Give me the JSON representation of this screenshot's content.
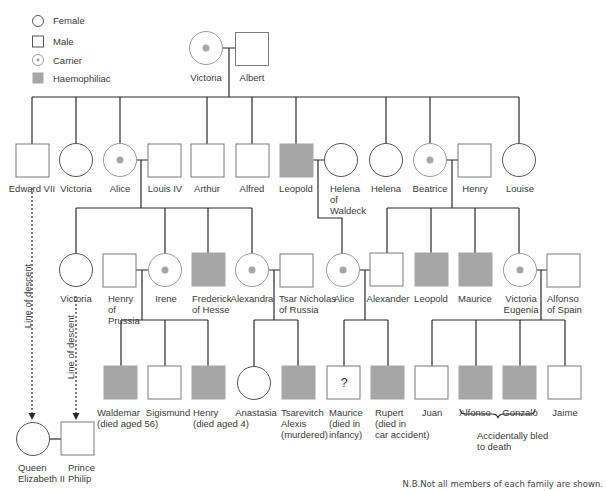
{
  "legend": {
    "items": [
      {
        "symbol": "female-circle",
        "label": "Female"
      },
      {
        "symbol": "male-square",
        "label": "Male"
      },
      {
        "symbol": "carrier-dot",
        "label": "Carrier"
      },
      {
        "symbol": "haemophiliac-fill",
        "label": "Haemophiliac"
      }
    ]
  },
  "colors": {
    "line": "#2a2a2a",
    "outline": "#8a8a8a",
    "affected": "#a6a6a6",
    "carrier_dot": "#a6a6a6"
  },
  "generation1": {
    "victoria": "Victoria",
    "albert": "Albert"
  },
  "generation2": {
    "edward": "Edward VII",
    "victoria": "Victoria",
    "alice": "Alice",
    "louis": "Louis IV",
    "arthur": "Arthur",
    "alfred": "Alfred",
    "leopold": "Leopold",
    "helena_waldeck": [
      "Helena",
      "of",
      "Waldeck"
    ],
    "helena": "Helena",
    "beatrice": "Beatrice",
    "henry": "Henry",
    "louise": "Louise"
  },
  "generation3": {
    "victoria": "Victoria",
    "henry_prussia": [
      "Henry",
      "of",
      "Prussia"
    ],
    "irene": "Irene",
    "frederick": [
      "Frederick",
      "of Hesse"
    ],
    "alexandra": "Alexandra",
    "tsar": [
      "Tsar Nicholas",
      "of Russia"
    ],
    "alice": "Alice",
    "alexander": "Alexander",
    "leopold": "Leopold",
    "maurice": "Maurice",
    "victoria_eugenia": [
      "Victoria",
      "Eugenia"
    ],
    "alfonso_spain": [
      "Alfonso",
      "of Spain"
    ]
  },
  "generation4": {
    "waldemar": [
      "Waldemar",
      "(died aged 56)"
    ],
    "sigismund": "Sigismund",
    "henry": [
      "Henry",
      "(died aged 4)"
    ],
    "anastasia": "Anastasia",
    "tsarevitch": [
      "Tsarevitch",
      "Alexis",
      "(murdered)"
    ],
    "maurice": [
      "Maurice",
      "(died in",
      "infancy)"
    ],
    "maurice_mark": "?",
    "rupert": [
      "Rupert",
      "(died in",
      "car accident)"
    ],
    "juan": "Juan",
    "alfonso": "Alfonso",
    "gonzalo": "Gonzalo",
    "jaime": "Jaime"
  },
  "descent": {
    "label1": "Line of descent",
    "label2": "Line of descent",
    "queen": [
      "Queen",
      "Elizabeth II"
    ],
    "philip": [
      "Prince",
      "Philip"
    ]
  },
  "annotations": {
    "bled": [
      "Accidentally bled",
      "to death"
    ],
    "note": "N.B.Not all members of each family are shown."
  }
}
